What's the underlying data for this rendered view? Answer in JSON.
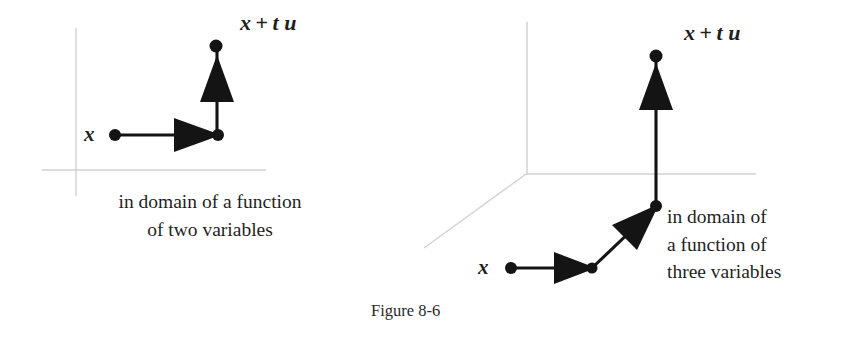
{
  "figure": {
    "caption": "Figure 8-6",
    "background_color": "#ffffff",
    "ink_color": "#141414",
    "axis_color": "#d2d2d4"
  },
  "panels": [
    {
      "id": "left",
      "name": "two-variable-domain-panel",
      "axes": {
        "type": "2d",
        "description": "two perpendicular light gray coordinate axes",
        "vertical_axis": {
          "x": 76,
          "y1": 28,
          "y2": 196
        },
        "horizontal_axis": {
          "y": 170,
          "x1": 42,
          "x2": 266
        }
      },
      "start_label": "x",
      "end_label_parts": {
        "x": "x",
        "plus": "+",
        "t": "t",
        "u": "u"
      },
      "end_label_text": "x + t u",
      "caption_lines": [
        "in domain of a function",
        "of  two variables"
      ],
      "points": {
        "start": {
          "x": 115,
          "y": 135
        },
        "corner": {
          "x": 218,
          "y": 135
        },
        "end": {
          "x": 216,
          "y": 46
        }
      }
    },
    {
      "id": "right",
      "name": "three-variable-domain-panel",
      "axes": {
        "type": "3d",
        "description": "three light gray coordinate axes in perspective",
        "vertical_axis": {
          "x": 527,
          "y1": 22,
          "y2": 175
        },
        "horizontal_axis": {
          "y": 174,
          "x1": 526,
          "x2": 756
        },
        "depth_axis": {
          "x1": 526,
          "y1": 174,
          "x2": 424,
          "y2": 248
        }
      },
      "start_label": "x",
      "end_label_parts": {
        "x": "x",
        "plus": "+",
        "t": "t",
        "u": "u"
      },
      "end_label_text": "x + t u",
      "caption_lines": [
        "in domain of",
        "a function of",
        "three variables"
      ],
      "points": {
        "start": {
          "x": 511,
          "y": 268
        },
        "corner1": {
          "x": 592,
          "y": 268
        },
        "corner2": {
          "x": 656,
          "y": 206
        },
        "end": {
          "x": 656,
          "y": 56
        }
      }
    }
  ]
}
